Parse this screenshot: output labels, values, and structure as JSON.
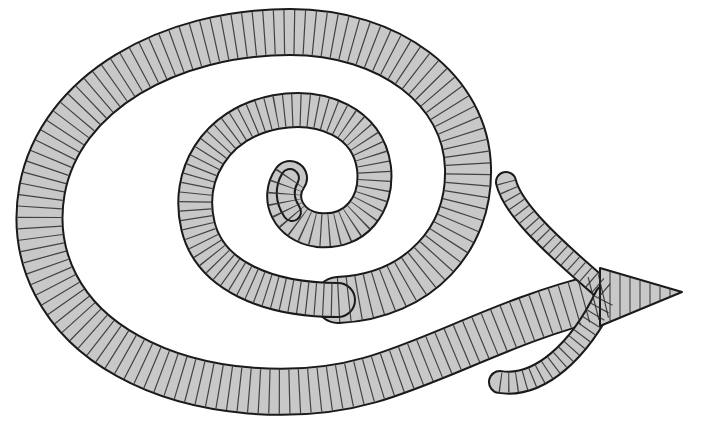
{
  "illustration": {
    "subject": "Hand-drawn spiral arrow",
    "description": "A thick banded spiral curling outward from the center, ending in an arrow pointing right",
    "colors": {
      "background": "#ffffff",
      "fill": "#c8c8c8",
      "outline": "#1a1a1a",
      "hatch": "#2a2a2a"
    },
    "arrow_direction": "right"
  }
}
